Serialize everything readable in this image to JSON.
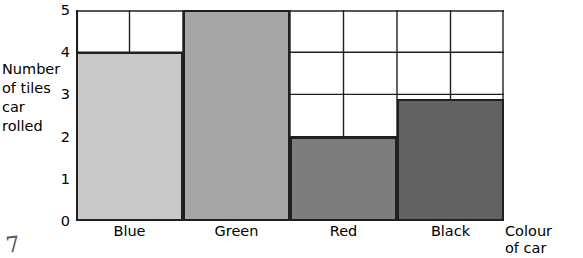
{
  "chart_data": {
    "type": "bar",
    "title": "",
    "categories": [
      "Blue",
      "Green",
      "Red",
      "Black"
    ],
    "values": [
      4,
      5,
      2,
      2.9
    ],
    "series": [
      {
        "name": "Number of tiles car rolled",
        "values": [
          4,
          5,
          2,
          2.9
        ]
      }
    ],
    "bar_colors": [
      "#c9c9c9",
      "#a6a6a6",
      "#7d7d7d",
      "#626262"
    ],
    "bar_outline": "#231f20",
    "ylabel_lines": [
      "Number",
      "of tiles",
      "car",
      "rolled"
    ],
    "xlabel_lines": [
      "Colour",
      "of car"
    ],
    "yticks": [
      "0",
      "1",
      "2",
      "3",
      "4",
      "5"
    ],
    "ylim": [
      0,
      5
    ],
    "grid": true,
    "legend": "none"
  },
  "annotations": {
    "pencil_mark": "7"
  }
}
